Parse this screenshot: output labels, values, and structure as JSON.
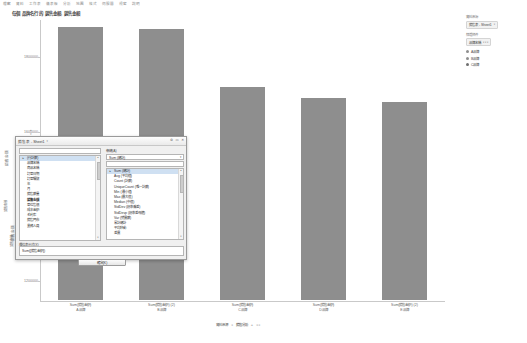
{
  "menubar": {
    "items": [
      "檔案",
      "資料",
      "工作表",
      "儀表板",
      "分析",
      "地圖",
      "格式",
      "伺服器",
      "視窗",
      "說明"
    ]
  },
  "chart": {
    "title": "每個 品牌名行 的 銷售金額, 銷售金額",
    "y_axis_title_1": "銷售金額",
    "y_axis_title_2": "銷售金額",
    "axis_arrows": "≡"
  },
  "chart_data": {
    "type": "bar",
    "title": "每個 品牌名行 的 銷售金額, 銷售金額",
    "xlabel": "",
    "ylabel": "銷售金額",
    "ylim": [
      1150000,
      1900000
    ],
    "yticks": [
      1200000,
      1400000,
      1600000,
      1800000
    ],
    "ytick_labels": [
      "1200000",
      "1400000",
      "1600000",
      "1800000"
    ],
    "grid": false,
    "legend_position": "right",
    "categories": [
      "A品牌",
      "B品牌",
      "C品牌",
      "D品牌",
      "E品牌"
    ],
    "measure_labels": [
      "Sum(銷售金額)",
      "Sum(銷售金額) (2)",
      "Sum(銷售金額)",
      "Sum(銷售金額)",
      "Sum(銷售金額) (2)"
    ],
    "values": [
      1880000,
      1875000,
      1720000,
      1690000,
      1680000
    ],
    "bar_color": "#8e8e8e"
  },
  "side_panel": {
    "source_head": "資料來源",
    "source_value": "銷售表 - Sheet1",
    "filter_head": "篩選條件",
    "filter_value": "品牌名稱",
    "legend_items": [
      {
        "label": "A品牌",
        "color": "#8e8e8e"
      },
      {
        "label": "B品牌",
        "color": "#8e8e8e"
      },
      {
        "label": "C品牌",
        "color": "#6f6f6f"
      }
    ]
  },
  "shelves": {
    "rows_label": "列",
    "columns_label": "欄",
    "marks_label": "標記",
    "vertical_1": "銷售金額",
    "vertical_2": "銷售金額"
  },
  "dialog": {
    "title": "銷售表 - Sheet1",
    "title_caret": "▾",
    "window_buttons": [
      "⚙",
      "▭",
      "✕"
    ],
    "search_label": "搜尋欄位",
    "search_value": "",
    "fields_label": "欄位",
    "fields": [
      {
        "label": "(行計數)",
        "selected": true,
        "bold": false
      },
      {
        "label": "品牌名稱",
        "selected": false,
        "bold": false
      },
      {
        "label": "商品名稱",
        "selected": false,
        "bold": false
      },
      {
        "label": "訂單日期",
        "selected": false,
        "bold": false
      },
      {
        "label": "訂單編號",
        "selected": false,
        "bold": false
      },
      {
        "label": "年",
        "selected": false,
        "bold": false
      },
      {
        "label": "月",
        "selected": false,
        "bold": false
      },
      {
        "label": "銷售數量",
        "selected": false,
        "bold": false
      },
      {
        "label": "銷售金額",
        "selected": false,
        "bold": true
      },
      {
        "label": "單位售價",
        "selected": false,
        "bold": false
      },
      {
        "label": "成本金額",
        "selected": false,
        "bold": false
      },
      {
        "label": "毛利率",
        "selected": false,
        "bold": false
      },
      {
        "label": "銷售門市",
        "selected": false,
        "bold": false
      },
      {
        "label": "業務人員",
        "selected": false,
        "bold": false
      }
    ],
    "aggregation_label": "彙總(A)",
    "aggregation_value": "Sum (總計)",
    "aggregation_filter": "",
    "aggregation_options": [
      {
        "label": "Sum (總計)",
        "selected": true
      },
      {
        "label": "Avg (平均值)",
        "selected": false
      },
      {
        "label": "Count (計數)",
        "selected": false
      },
      {
        "label": "UniqueCount (唯一計數)",
        "selected": false
      },
      {
        "label": "Min (最小值)",
        "selected": false
      },
      {
        "label": "Max (最大值)",
        "selected": false
      },
      {
        "label": "Median (中值)",
        "selected": false
      },
      {
        "label": "StdDev (標準偏差)",
        "selected": false
      },
      {
        "label": "StdDevp (標準差母體)",
        "selected": false
      },
      {
        "label": "Var (變異數)",
        "selected": false
      },
      {
        "label": "累計總計",
        "selected": false
      },
      {
        "label": "平均移動",
        "selected": false
      },
      {
        "label": "差異",
        "selected": false
      }
    ],
    "formula_label": "欄位表示式(X)",
    "formula_value": "Sum([銷售金額])",
    "ok_label": "確定(K)"
  },
  "sheetbar": {
    "tabs": [
      "資料來源",
      "銷售分析"
    ],
    "separator": "◂",
    "add": "+",
    "nav": "◂ ▸"
  }
}
